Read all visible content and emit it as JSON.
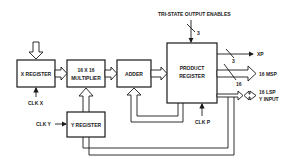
{
  "diagram": {
    "title": "TRI-STATE OUTPUT ENABLES",
    "blocks": {
      "x_register": "X REGISTER",
      "multiplier_line1": "16 X 16",
      "multiplier_line2": "MULTIPLIER",
      "adder": "ADDER",
      "product_register_line1": "PRODUCT",
      "product_register_line2": "REGISTER",
      "y_register": "Y REGISTER"
    },
    "clocks": {
      "clk_x": "CLK X",
      "clk_y": "CLK Y",
      "clk_p": "CLK P"
    },
    "bus_widths": {
      "enables": "3",
      "xp": "3",
      "msp": "16"
    },
    "outputs": {
      "xp": "XP",
      "msp": "16 MSP",
      "lsp_line1": "16 LSP",
      "lsp_line2": "Y INPUT"
    }
  }
}
